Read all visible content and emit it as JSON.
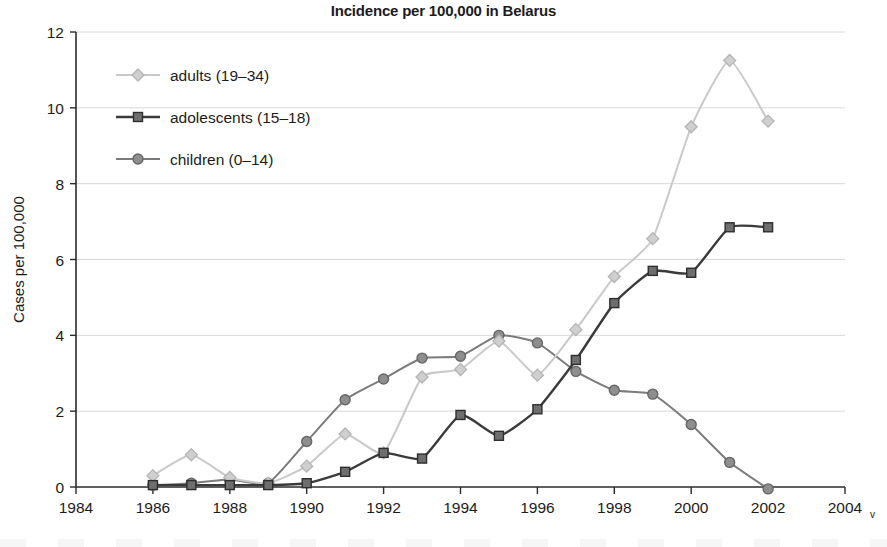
{
  "chart_data": {
    "type": "line",
    "title": "Incidence per 100,000 in Belarus",
    "xlabel": "",
    "ylabel": "Cases per 100,000",
    "x": [
      1986,
      1987,
      1988,
      1989,
      1990,
      1991,
      1992,
      1993,
      1994,
      1995,
      1996,
      1997,
      1998,
      1999,
      2000,
      2001,
      2002
    ],
    "xlim": [
      1984,
      2004
    ],
    "ylim": [
      0,
      12
    ],
    "xticks": [
      "1984",
      "1986",
      "1988",
      "1990",
      "1992",
      "1994",
      "1996",
      "1998",
      "2000",
      "2002",
      "2004"
    ],
    "xtick_suffix": "v",
    "yticks": [
      "0",
      "2",
      "4",
      "6",
      "8",
      "10",
      "12"
    ],
    "grid": "horizontal",
    "legend_position": "upper-left-inside",
    "series": [
      {
        "name": "adults (19–34)",
        "marker": "diamond",
        "color": "#c9c9c9",
        "marker_fill": "#cfcfcf",
        "marker_stroke": "#b4b4b4",
        "values": [
          0.3,
          0.85,
          0.25,
          0.1,
          0.55,
          1.4,
          0.9,
          2.9,
          3.1,
          3.85,
          2.95,
          4.15,
          5.55,
          6.55,
          9.5,
          11.25,
          9.65
        ]
      },
      {
        "name": "adolescents (15–18)",
        "marker": "square",
        "color": "#3a3a3a",
        "marker_fill": "#6e6e6e",
        "marker_stroke": "#2e2e2e",
        "values": [
          0.05,
          0.05,
          0.05,
          0.05,
          0.1,
          0.4,
          0.9,
          0.75,
          1.9,
          1.35,
          2.05,
          3.35,
          4.85,
          5.7,
          5.65,
          6.85,
          6.85
        ]
      },
      {
        "name": "children (0–14)",
        "marker": "circle",
        "color": "#7b7b7b",
        "marker_fill": "#8e8e8e",
        "marker_stroke": "#666666",
        "values": [
          0.05,
          0.1,
          0.2,
          0.1,
          1.2,
          2.3,
          2.85,
          3.4,
          3.45,
          4.0,
          3.8,
          3.05,
          2.55,
          2.45,
          1.65,
          0.65,
          -0.05
        ]
      }
    ],
    "series_x": {
      "adults (19–34)": [
        1986,
        1987,
        1988,
        1989,
        1990,
        1991,
        1992,
        1993,
        1994,
        1995,
        1996,
        1997,
        1998,
        1999,
        2000,
        2001,
        2002
      ],
      "adolescents (15–18)": [
        1986,
        1987,
        1988,
        1989,
        1990,
        1991,
        1992,
        1993,
        1994,
        1995,
        1996,
        1997,
        1998,
        1999,
        2000,
        2001,
        2002
      ],
      "children (0–14)": [
        1986,
        1987,
        1988,
        1989,
        1990,
        1991,
        1992,
        1993,
        1994,
        1995,
        1996,
        1997,
        1998,
        1999,
        2000,
        2001,
        2002
      ]
    }
  },
  "legend": {
    "items": [
      {
        "label": "adults (19–34)"
      },
      {
        "label": "adolescents (15–18)"
      },
      {
        "label": "children (0–14)"
      }
    ]
  }
}
